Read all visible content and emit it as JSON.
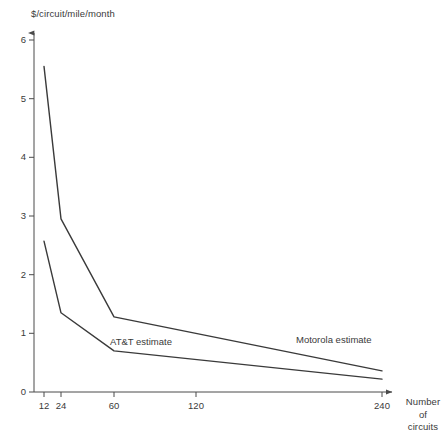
{
  "chart_data": {
    "type": "line",
    "title": "",
    "xlabel": "Number of circuits",
    "ylabel": "$/circuit/mile/month",
    "x_tick_labels": [
      "12",
      "24",
      "60",
      "120",
      "240"
    ],
    "x_tick_values": [
      12,
      24,
      60,
      120,
      240
    ],
    "y_tick_labels": [
      "0",
      "1",
      "2",
      "3",
      "4",
      "5",
      "6"
    ],
    "y_tick_values": [
      0,
      1,
      2,
      3,
      4,
      5,
      6
    ],
    "ylim": [
      0,
      6.2
    ],
    "grid": false,
    "legend_position": "inline-annotation",
    "series": [
      {
        "name": "Motorola estimate",
        "x": [
          12,
          24,
          60,
          240
        ],
        "values": [
          5.55,
          2.95,
          1.28,
          0.36
        ],
        "color": "#3a3a3a"
      },
      {
        "name": "AT&T estimate",
        "x": [
          12,
          24,
          60,
          240
        ],
        "values": [
          2.57,
          1.35,
          0.7,
          0.22
        ],
        "color": "#3a3a3a"
      }
    ],
    "annotations": [
      {
        "text": "AT&T estimate",
        "series": "AT&T estimate"
      },
      {
        "text": "Motorola estimate",
        "series": "Motorola estimate"
      }
    ]
  },
  "axis": {
    "y_title": "$/circuit/mile/month",
    "x_title_lines": [
      "Number",
      "of",
      "circuits"
    ]
  },
  "colors": {
    "line": "#3a3a3a",
    "axis": "#4a4a4a",
    "text": "#3a3a3a",
    "background": "#ffffff"
  }
}
